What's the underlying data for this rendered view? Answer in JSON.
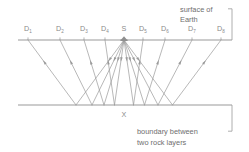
{
  "diagram": {
    "background_color": "#ffffff",
    "line_color": "#9a9a9a",
    "text_color": "#8a8a8a",
    "annotation_color": "#6e6e6e",
    "surface": {
      "label_line1": "surface of",
      "label_line2": "Earth",
      "y": 40
    },
    "boundary": {
      "label_line1": "boundary  between",
      "label_line2": "two rock layers",
      "y": 105
    },
    "source": {
      "label": "S",
      "x": 124,
      "y": 40
    },
    "reflection_point": {
      "label": "X",
      "x": 124,
      "y": 105
    },
    "detectors": [
      {
        "label": "D",
        "sub": "1",
        "x": 28
      },
      {
        "label": "D",
        "sub": "2",
        "x": 60
      },
      {
        "label": "D",
        "sub": "3",
        "x": 84
      },
      {
        "label": "D",
        "sub": "4",
        "x": 105
      },
      {
        "label": "D",
        "sub": "5",
        "x": 143
      },
      {
        "label": "D",
        "sub": "6",
        "x": 165
      },
      {
        "label": "D",
        "sub": "7",
        "x": 192
      },
      {
        "label": "D",
        "sub": "8",
        "x": 221
      }
    ]
  }
}
